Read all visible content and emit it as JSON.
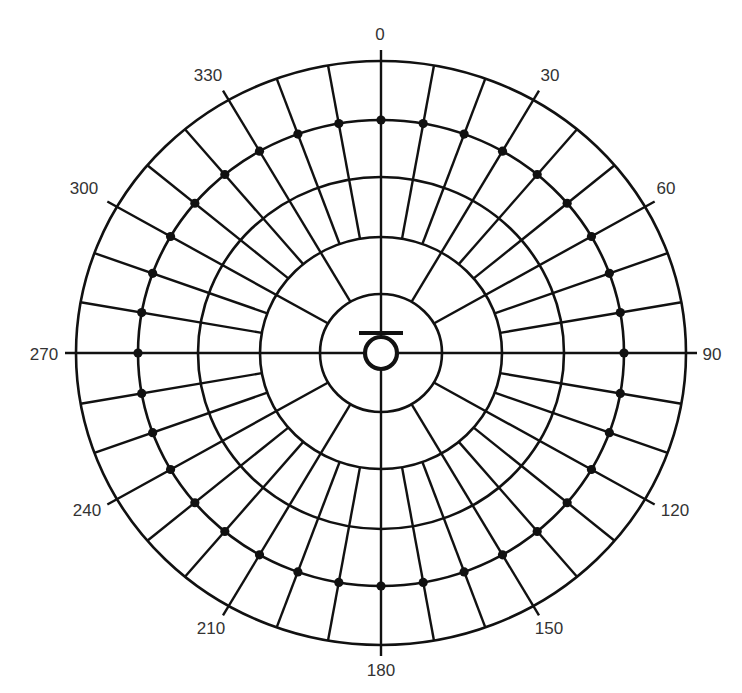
{
  "diagram": {
    "type": "polar-grid",
    "center": [
      381,
      353
    ],
    "rings_rx": [
      61,
      121,
      183,
      243,
      305
    ],
    "rings_ry": [
      59,
      116,
      176,
      233,
      292
    ],
    "dot_ring_index": 3,
    "dot_step_deg": 10,
    "minor_spoke_step_deg": 10,
    "major_spoke_step_deg": 30,
    "tick_length": 11,
    "hub": {
      "radius": 18,
      "bar_half_width": 22,
      "bar_offset_y": -20
    },
    "stroke_color": "#111111",
    "label_color": "#333333",
    "angle_labels": [
      {
        "text": "0",
        "angle": 0,
        "x": 380,
        "y": 40
      },
      {
        "text": "30",
        "angle": 30,
        "x": 550,
        "y": 81
      },
      {
        "text": "60",
        "angle": 60,
        "x": 666,
        "y": 194
      },
      {
        "text": "90",
        "angle": 90,
        "x": 712,
        "y": 360
      },
      {
        "text": "120",
        "angle": 120,
        "x": 675,
        "y": 516
      },
      {
        "text": "150",
        "angle": 150,
        "x": 549,
        "y": 634
      },
      {
        "text": "180",
        "angle": 180,
        "x": 381,
        "y": 676
      },
      {
        "text": "210",
        "angle": 210,
        "x": 211,
        "y": 634
      },
      {
        "text": "240",
        "angle": 240,
        "x": 87,
        "y": 516
      },
      {
        "text": "270",
        "angle": 270,
        "x": 44,
        "y": 360
      },
      {
        "text": "300",
        "angle": 300,
        "x": 84,
        "y": 194
      },
      {
        "text": "330",
        "angle": 330,
        "x": 208,
        "y": 81
      }
    ]
  }
}
